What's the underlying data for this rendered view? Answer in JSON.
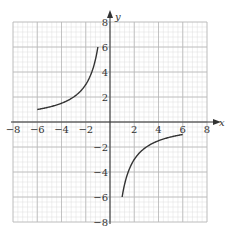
{
  "chart_data": {
    "type": "line",
    "title": "",
    "function": "y = -6/x",
    "xlabel": "x",
    "ylabel": "y",
    "xlim": [
      -8,
      8
    ],
    "ylim": [
      -8,
      8
    ],
    "grid": true,
    "minor_grid_step": 0.4,
    "major_grid_step": 2,
    "x_ticks": [
      -8,
      -6,
      -4,
      -2,
      2,
      4,
      6,
      8
    ],
    "y_ticks": [
      -8,
      -6,
      -4,
      -2,
      2,
      4,
      6,
      8
    ],
    "x_tick_labels": [
      "−8",
      "−6",
      "−4",
      "−2",
      "2",
      "4",
      "6",
      "8"
    ],
    "y_tick_labels": [
      "−8",
      "−6",
      "−4",
      "−2",
      "2",
      "4",
      "6",
      "8"
    ],
    "series": [
      {
        "name": "left-branch",
        "x": [
          -6,
          -5,
          -4,
          -3,
          -2.5,
          -2,
          -1.5,
          -1.2,
          -1
        ],
        "y": [
          1,
          1.2,
          1.5,
          2,
          2.4,
          3,
          4,
          5,
          6
        ]
      },
      {
        "name": "right-branch",
        "x": [
          1,
          1.2,
          1.5,
          2,
          2.5,
          3,
          4,
          5,
          6
        ],
        "y": [
          -6,
          -5,
          -4,
          -3,
          -2.4,
          -2,
          -1.5,
          -1.2,
          -1
        ]
      }
    ],
    "legend": null
  },
  "colors": {
    "curve": "#333333",
    "axis": "#333333",
    "major_grid": "#b8b8b8",
    "minor_grid": "#dedede"
  }
}
